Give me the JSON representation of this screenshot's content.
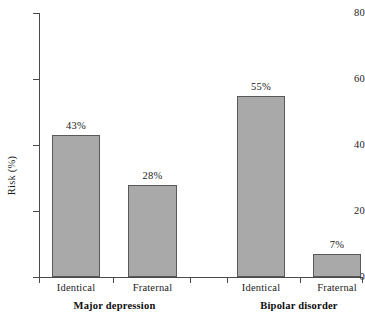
{
  "chart_data": {
    "type": "bar",
    "title": "",
    "xlabel": "",
    "ylabel": "Risk (%)",
    "ylim": [
      0,
      80
    ],
    "yticks": [
      "0",
      "20",
      "40",
      "60",
      "80"
    ],
    "ytick_values": [
      0,
      20,
      40,
      60,
      80
    ],
    "grid": false,
    "legend": "none",
    "categories": [
      "Identical",
      "Fraternal",
      "Identical",
      "Fraternal"
    ],
    "values": [
      43,
      28,
      55,
      7
    ],
    "value_labels": [
      "43%",
      "28%",
      "55%",
      "7%"
    ],
    "groups": [
      {
        "label": "Major depression",
        "categories": [
          "Identical",
          "Fraternal"
        ],
        "values": [
          43,
          28
        ]
      },
      {
        "label": "Bipolar disorder",
        "categories": [
          "Identical",
          "Fraternal"
        ],
        "values": [
          55,
          7
        ]
      }
    ],
    "bar_color": "#a9a9a9",
    "bar_border_color": "#595959",
    "axis_color": "#4a4a4a"
  }
}
